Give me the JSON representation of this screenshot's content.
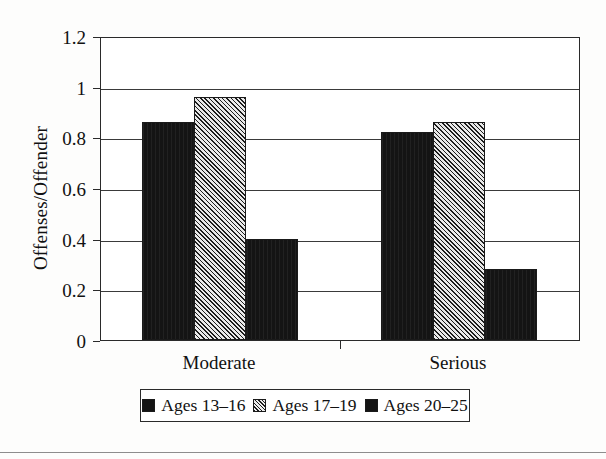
{
  "chart_data": {
    "type": "bar",
    "title": "",
    "subtitle": "",
    "xlabel": "",
    "ylabel": "Offenses/Offender",
    "categories": [
      "Moderate",
      "Serious"
    ],
    "series": [
      {
        "name": "Ages 13–16",
        "values": [
          0.86,
          0.82
        ],
        "swatch": "solid",
        "color": "#141414"
      },
      {
        "name": "Ages 17–19",
        "values": [
          0.96,
          0.86
        ],
        "swatch": "hatch",
        "color": "#d2d2d2"
      },
      {
        "name": "Ages 20–25",
        "values": [
          0.4,
          0.28
        ],
        "swatch": "solid",
        "color": "#141414"
      }
    ],
    "ylim": [
      0,
      1.2
    ],
    "yticks": [
      0,
      0.2,
      0.4,
      0.6,
      0.8,
      1,
      1.2
    ],
    "ytick_labels": [
      "0",
      "0.2",
      "0.4",
      "0.6",
      "0.8",
      "1",
      "1.2"
    ],
    "grid": "horizontal",
    "legend_position": "bottom",
    "legend_box": true,
    "plot_border": true
  },
  "axis": {
    "y_title": "Offenses/Offender"
  },
  "legend": {
    "items": [
      {
        "label": "Ages 13–16"
      },
      {
        "label": "Ages 17–19"
      },
      {
        "label": "Ages 20–25"
      }
    ]
  }
}
